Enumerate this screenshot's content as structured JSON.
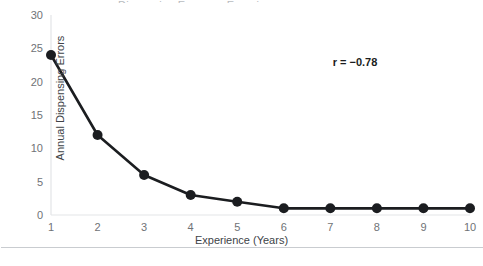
{
  "figure": {
    "cropped_title_fragment": "Dispensing Errors vs Experience",
    "background_color": "#ffffff",
    "frame_color": "#c9ccd0"
  },
  "chart_data": {
    "type": "line",
    "title": "",
    "xlabel": "Experience (Years)",
    "ylabel": "Annual Dispensing Errors",
    "x": [
      1,
      2,
      3,
      4,
      5,
      6,
      7,
      8,
      9,
      10
    ],
    "values": [
      24,
      12,
      6,
      3,
      2,
      1,
      1,
      1,
      1,
      1
    ],
    "xtick_labels": [
      "1",
      "2",
      "3",
      "4",
      "5",
      "6",
      "7",
      "8",
      "9",
      "10"
    ],
    "ytick_labels": [
      "0",
      "5",
      "10",
      "15",
      "20",
      "25",
      "30"
    ],
    "yticks": [
      0,
      5,
      10,
      15,
      20,
      25,
      30
    ],
    "xlim": [
      1,
      10
    ],
    "ylim": [
      0,
      30
    ],
    "grid": false,
    "legend": null,
    "series_color": "#1b1d20",
    "marker": "circle",
    "marker_size": 5,
    "line_width": 2.6,
    "annotations": [
      {
        "text": "r = −0.78",
        "x": 7.5,
        "y": 22,
        "bold": true,
        "color": "#1b1d20"
      }
    ],
    "axis_color": "#e3e5e7",
    "tick_label_color": "#6f7276"
  }
}
